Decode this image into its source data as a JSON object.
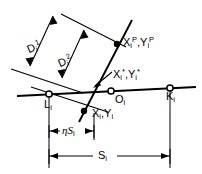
{
  "figure": {
    "background_color": "#ffffff",
    "line_color": "#000000",
    "labels": {
      "d1": "D",
      "d1_sub": "i",
      "d1_sup": "1",
      "d2": "D",
      "d2_sub": "i",
      "d2_sup": "2",
      "xp": "X",
      "xp_sub": "i",
      "xp_sup": "P",
      "comma_1": ",",
      "yp": "Y",
      "yp_sub": "i",
      "yp_sup": "P",
      "xstar": "X",
      "xstar_sub": "i",
      "xstar_sup": "*",
      "comma_2": ",",
      "ystar": "Y",
      "ystar_sub": "i",
      "ystar_sup": "*",
      "x": "X",
      "x_sub": "i",
      "comma_3": ",",
      "y": "Y",
      "y_sub": "i",
      "l": "L",
      "l_sub": "i",
      "o": "O",
      "o_sub": "i",
      "k": "K",
      "k_sub": "i",
      "eta_s": "ηS",
      "eta_s_sub": "i",
      "s": "S",
      "s_sub": "i"
    },
    "points": [
      {
        "name": "L_i",
        "type": "open-circle",
        "x": 49,
        "y": 94
      },
      {
        "name": "O_i",
        "type": "open-circle",
        "x": 111,
        "y": 91
      },
      {
        "name": "K_i",
        "type": "open-circle",
        "x": 170,
        "y": 88
      },
      {
        "name": "P_i",
        "type": "filled-dot",
        "x": 117,
        "y": 44
      },
      {
        "name": "X_i_Y_i",
        "type": "filled-dot",
        "x": 84,
        "y": 111
      }
    ]
  }
}
